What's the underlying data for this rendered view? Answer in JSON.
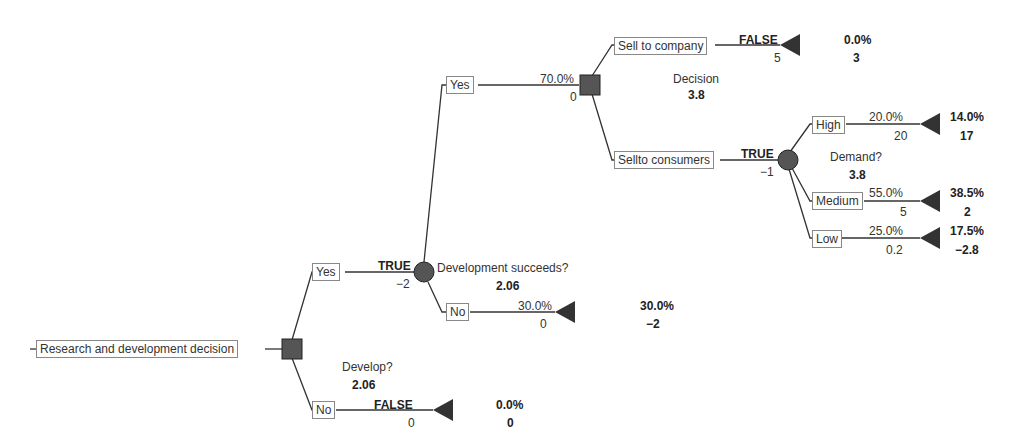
{
  "diagram": {
    "type": "decision-tree",
    "root": {
      "label": "Research and development decision"
    },
    "develop": {
      "name": "Develop?",
      "value": "2.06"
    },
    "develop_yes": {
      "label": "Yes",
      "flag": "TRUE",
      "cost": "−2"
    },
    "develop_no": {
      "label": "No",
      "flag": "FALSE",
      "value": "0",
      "prob": "0.0%",
      "payoff": "0"
    },
    "dev_success": {
      "name": "Development succeeds?",
      "value": "2.06"
    },
    "success_yes": {
      "label": "Yes",
      "prob": "70.0%",
      "value": "0"
    },
    "success_no": {
      "label": "No",
      "prob": "30.0%",
      "value": "0",
      "final_prob": "30.0%",
      "payoff": "−2"
    },
    "decision": {
      "name": "Decision",
      "value": "3.8"
    },
    "sell_company": {
      "label": "Sell to company",
      "flag": "FALSE",
      "value": "5",
      "final_prob": "0.0%",
      "payoff": "3"
    },
    "sell_consumers": {
      "label": "Sellto consumers",
      "flag": "TRUE",
      "value": "−1"
    },
    "demand": {
      "name": "Demand?",
      "value": "3.8"
    },
    "high": {
      "label": "High",
      "prob": "20.0%",
      "value": "20",
      "final_prob": "14.0%",
      "payoff": "17"
    },
    "medium": {
      "label": "Medium",
      "prob": "55.0%",
      "value": "5",
      "final_prob": "38.5%",
      "payoff": "2"
    },
    "low": {
      "label": "Low",
      "prob": "25.0%",
      "value": "0.2",
      "final_prob": "17.5%",
      "payoff": "−2.8"
    }
  },
  "colors": {
    "line": "#333333",
    "node_fill": "#555555",
    "box_border": "#888888"
  }
}
